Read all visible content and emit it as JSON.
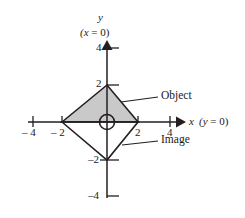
{
  "figure": {
    "kind": "coordinate-plane-diagram",
    "background_color": "#ffffff",
    "line_color": "#231f20",
    "shape_fill_color": "#c9c9c9"
  },
  "axes": {
    "x": {
      "name": "x",
      "condition": "(y = 0)",
      "tick_labels": [
        "– 4",
        "– 2",
        "2",
        "4"
      ],
      "tick_values": [
        -4,
        -2,
        2,
        4
      ],
      "range": [
        -4.4,
        4.4
      ],
      "arrow": "right"
    },
    "y": {
      "name": "y",
      "condition": "(x = 0)",
      "tick_labels": [
        "4",
        "2",
        "–2",
        "–4"
      ],
      "tick_values": [
        4,
        2,
        -2,
        -4
      ],
      "range": [
        -4.4,
        4.4
      ],
      "arrow": "up"
    }
  },
  "origin_marker": {
    "name": "origin-circle",
    "symbol": "⊕"
  },
  "shapes": [
    {
      "id": "object",
      "label": "Object",
      "filled": true,
      "fill": "#c9c9c9",
      "vertices": [
        [
          -2,
          0
        ],
        [
          0,
          2
        ],
        [
          2,
          0
        ]
      ]
    },
    {
      "id": "image",
      "label": "Image",
      "filled": false,
      "fill": "#ffffff",
      "vertices": [
        [
          -2,
          0
        ],
        [
          0,
          -2
        ],
        [
          2,
          0
        ]
      ]
    }
  ],
  "callouts": [
    {
      "id": "object-callout",
      "text": "Object"
    },
    {
      "id": "image-callout",
      "text": "Image"
    }
  ]
}
